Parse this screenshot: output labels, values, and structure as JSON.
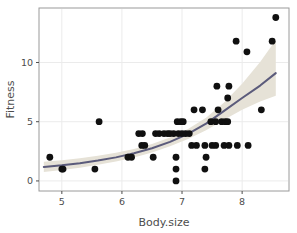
{
  "chart_data": {
    "type": "scatter",
    "title": "",
    "xlabel": "Body.size",
    "ylabel": "Fitness",
    "xlim": [
      4.62,
      8.78
    ],
    "ylim": [
      -0.85,
      14.6
    ],
    "xticks": [
      5,
      6,
      7,
      8
    ],
    "xtick_labels": [
      "5",
      "6",
      "7",
      "8"
    ],
    "yticks": [
      0,
      5,
      10
    ],
    "ytick_labels": [
      "0",
      "5",
      "10"
    ],
    "grid": "major-only-light",
    "legend": "none",
    "points": [
      {
        "x": 4.8,
        "y": 2
      },
      {
        "x": 5.0,
        "y": 1
      },
      {
        "x": 5.02,
        "y": 1
      },
      {
        "x": 5.55,
        "y": 1
      },
      {
        "x": 5.62,
        "y": 5
      },
      {
        "x": 6.1,
        "y": 2
      },
      {
        "x": 6.16,
        "y": 2
      },
      {
        "x": 6.28,
        "y": 4
      },
      {
        "x": 6.34,
        "y": 4
      },
      {
        "x": 6.33,
        "y": 3
      },
      {
        "x": 6.38,
        "y": 3
      },
      {
        "x": 6.52,
        "y": 2
      },
      {
        "x": 6.56,
        "y": 4
      },
      {
        "x": 6.62,
        "y": 4
      },
      {
        "x": 6.7,
        "y": 4
      },
      {
        "x": 6.76,
        "y": 4
      },
      {
        "x": 6.8,
        "y": 4
      },
      {
        "x": 6.86,
        "y": 4
      },
      {
        "x": 6.9,
        "y": 0
      },
      {
        "x": 6.9,
        "y": 1
      },
      {
        "x": 6.9,
        "y": 2
      },
      {
        "x": 6.92,
        "y": 5
      },
      {
        "x": 6.98,
        "y": 5
      },
      {
        "x": 7.02,
        "y": 5
      },
      {
        "x": 6.94,
        "y": 4
      },
      {
        "x": 7.0,
        "y": 4
      },
      {
        "x": 7.06,
        "y": 4
      },
      {
        "x": 7.12,
        "y": 4
      },
      {
        "x": 7.16,
        "y": 3
      },
      {
        "x": 7.24,
        "y": 3
      },
      {
        "x": 7.2,
        "y": 6
      },
      {
        "x": 7.34,
        "y": 6
      },
      {
        "x": 7.38,
        "y": 1
      },
      {
        "x": 7.4,
        "y": 2
      },
      {
        "x": 7.38,
        "y": 3
      },
      {
        "x": 7.5,
        "y": 3
      },
      {
        "x": 7.56,
        "y": 3
      },
      {
        "x": 7.58,
        "y": 8
      },
      {
        "x": 7.6,
        "y": 6
      },
      {
        "x": 7.48,
        "y": 5
      },
      {
        "x": 7.56,
        "y": 5
      },
      {
        "x": 7.66,
        "y": 5
      },
      {
        "x": 7.72,
        "y": 5
      },
      {
        "x": 7.76,
        "y": 5
      },
      {
        "x": 7.78,
        "y": 8
      },
      {
        "x": 7.76,
        "y": 7
      },
      {
        "x": 7.7,
        "y": 3
      },
      {
        "x": 7.78,
        "y": 3
      },
      {
        "x": 7.9,
        "y": 11.8
      },
      {
        "x": 7.92,
        "y": 3
      },
      {
        "x": 8.08,
        "y": 10.9
      },
      {
        "x": 8.1,
        "y": 3
      },
      {
        "x": 8.32,
        "y": 6
      },
      {
        "x": 8.5,
        "y": 11.8
      },
      {
        "x": 8.56,
        "y": 13.8
      }
    ],
    "fit_line": {
      "type": "exponential-glm-fit",
      "color": "#5b5b7b",
      "points": [
        {
          "x": 4.7,
          "y": 1.18
        },
        {
          "x": 5.0,
          "y": 1.32
        },
        {
          "x": 5.3,
          "y": 1.5
        },
        {
          "x": 5.6,
          "y": 1.72
        },
        {
          "x": 5.9,
          "y": 1.99
        },
        {
          "x": 6.2,
          "y": 2.33
        },
        {
          "x": 6.5,
          "y": 2.76
        },
        {
          "x": 6.8,
          "y": 3.3
        },
        {
          "x": 7.1,
          "y": 3.98
        },
        {
          "x": 7.4,
          "y": 4.84
        },
        {
          "x": 7.7,
          "y": 5.92
        },
        {
          "x": 8.0,
          "y": 7.0
        },
        {
          "x": 8.3,
          "y": 8.05
        },
        {
          "x": 8.56,
          "y": 9.1
        }
      ]
    },
    "confidence_ribbon": {
      "color": "#e6e2d7",
      "upper": [
        {
          "x": 4.7,
          "y": 1.62
        },
        {
          "x": 5.0,
          "y": 1.74
        },
        {
          "x": 5.3,
          "y": 1.92
        },
        {
          "x": 5.6,
          "y": 2.12
        },
        {
          "x": 5.9,
          "y": 2.38
        },
        {
          "x": 6.2,
          "y": 2.7
        },
        {
          "x": 6.5,
          "y": 3.12
        },
        {
          "x": 6.8,
          "y": 3.66
        },
        {
          "x": 7.1,
          "y": 4.38
        },
        {
          "x": 7.4,
          "y": 5.34
        },
        {
          "x": 7.7,
          "y": 6.62
        },
        {
          "x": 8.0,
          "y": 8.2
        },
        {
          "x": 8.3,
          "y": 10.05
        },
        {
          "x": 8.56,
          "y": 11.9
        }
      ],
      "lower": [
        {
          "x": 4.7,
          "y": 0.76
        },
        {
          "x": 5.0,
          "y": 0.92
        },
        {
          "x": 5.3,
          "y": 1.12
        },
        {
          "x": 5.6,
          "y": 1.36
        },
        {
          "x": 5.9,
          "y": 1.64
        },
        {
          "x": 6.2,
          "y": 1.98
        },
        {
          "x": 6.5,
          "y": 2.4
        },
        {
          "x": 6.8,
          "y": 2.92
        },
        {
          "x": 7.1,
          "y": 3.54
        },
        {
          "x": 7.4,
          "y": 4.28
        },
        {
          "x": 7.7,
          "y": 5.16
        },
        {
          "x": 8.0,
          "y": 6.02
        },
        {
          "x": 8.3,
          "y": 6.7
        },
        {
          "x": 8.56,
          "y": 7.2
        }
      ]
    },
    "style": {
      "point_color": "#101010",
      "point_radius": 3.4,
      "panel_background": "#ffffff",
      "panel_border": "#9a9a9a",
      "grid_color": "#ebebeb",
      "text_color": "#4d4d4d"
    }
  }
}
